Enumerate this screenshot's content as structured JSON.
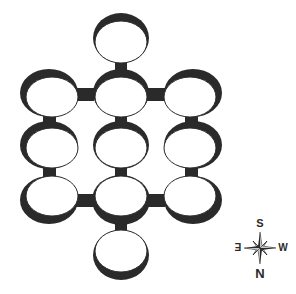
{
  "diagram": {
    "type": "ring-platform-grid",
    "colors": {
      "ink": "#2a2a2a",
      "background": "#ffffff"
    },
    "rings": [
      {
        "id": "top",
        "cx": 121,
        "cy": 40,
        "shade": "top"
      },
      {
        "id": "r1-left",
        "cx": 50,
        "cy": 95,
        "shade": "top"
      },
      {
        "id": "r1-center",
        "cx": 121,
        "cy": 95,
        "shade": "top"
      },
      {
        "id": "r1-right",
        "cx": 192,
        "cy": 95,
        "shade": "top"
      },
      {
        "id": "r2-left",
        "cx": 50,
        "cy": 146,
        "shade": "top"
      },
      {
        "id": "r2-center",
        "cx": 121,
        "cy": 146,
        "shade": "top"
      },
      {
        "id": "r2-right",
        "cx": 192,
        "cy": 146,
        "shade": "top"
      },
      {
        "id": "r3-left",
        "cx": 50,
        "cy": 198,
        "shade": "bottom"
      },
      {
        "id": "r3-center",
        "cx": 121,
        "cy": 198,
        "shade": "bottom"
      },
      {
        "id": "r3-right",
        "cx": 192,
        "cy": 198,
        "shade": "bottom"
      },
      {
        "id": "bottom",
        "cx": 121,
        "cy": 252,
        "shade": "bottom"
      }
    ],
    "bridges": [
      {
        "from": "top",
        "to": "r1-center"
      },
      {
        "from": "r1-left",
        "to": "r1-center"
      },
      {
        "from": "r1-center",
        "to": "r1-right"
      },
      {
        "from": "r1-left",
        "to": "r2-left"
      },
      {
        "from": "r1-center",
        "to": "r2-center"
      },
      {
        "from": "r1-right",
        "to": "r2-right"
      },
      {
        "from": "r2-left",
        "to": "r3-left"
      },
      {
        "from": "r2-center",
        "to": "r3-center"
      },
      {
        "from": "r2-right",
        "to": "r3-right"
      },
      {
        "from": "r3-left",
        "to": "r3-center"
      },
      {
        "from": "r3-center",
        "to": "r3-right"
      },
      {
        "from": "r3-center",
        "to": "bottom"
      }
    ]
  },
  "compass": {
    "icon": "compass-rose-icon",
    "top_label": "S",
    "bottom_label": "N",
    "left_label": "E",
    "right_label": "W"
  }
}
